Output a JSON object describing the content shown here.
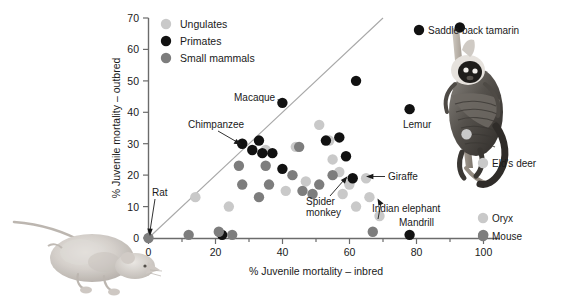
{
  "figure": {
    "title": "",
    "background": "#ffffff"
  },
  "colors": {
    "ungulates": "#c9c9c9",
    "primates": "#111111",
    "small_mammals": "#7d7d7d",
    "axis": "#6b6b6b",
    "diagonal": "#a8a8a8",
    "text": "#1a1a1a"
  },
  "axes": {
    "xlabel": "% Juvenile mortality – inbred",
    "ylabel": "% Juvenile mortality – outbred",
    "xticks": [
      0,
      20,
      40,
      60,
      80,
      100
    ],
    "xtick_labels": [
      "0",
      "20",
      "40",
      "60",
      "80",
      "100"
    ],
    "xminor": [
      10,
      30,
      50,
      70,
      90
    ],
    "yticks": [
      0,
      10,
      20,
      30,
      40,
      50,
      60,
      70
    ],
    "ytick_labels": [
      "0",
      "10",
      "20",
      "30",
      "40",
      "50",
      "60",
      "70"
    ],
    "xlim": [
      0,
      105
    ],
    "ylim": [
      0,
      70
    ],
    "grid": false
  },
  "legend": {
    "position": "top-left-inside",
    "entries": [
      {
        "label": "Ungulates",
        "color_key": "ungulates"
      },
      {
        "label": "Primates",
        "color_key": "primates"
      },
      {
        "label": "Small mammals",
        "color_key": "small_mammals"
      }
    ]
  },
  "reference_line": {
    "type": "identity",
    "label": "1:1 line",
    "from": [
      0,
      0
    ],
    "to": [
      70,
      70
    ]
  },
  "illustrations": [
    {
      "name": "rat-illustration",
      "caption": "Rat"
    },
    {
      "name": "saddle-back-tamarin-illustration",
      "caption": "Saddle back tamarin"
    }
  ],
  "chart_data": {
    "type": "scatter",
    "title": "",
    "xlabel": "% Juvenile mortality – inbred",
    "ylabel": "% Juvenile mortality – outbred",
    "xlim": [
      0,
      105
    ],
    "ylim": [
      0,
      70
    ],
    "grid": false,
    "legend_position": "upper left",
    "series": [
      {
        "name": "Ungulates",
        "color": "#c9c9c9",
        "points": [
          {
            "x": 14,
            "y": 13
          },
          {
            "x": 24,
            "y": 10
          },
          {
            "x": 28,
            "y": 30
          },
          {
            "x": 35,
            "y": 28
          },
          {
            "x": 41,
            "y": 15
          },
          {
            "x": 44,
            "y": 29
          },
          {
            "x": 47,
            "y": 18
          },
          {
            "x": 51,
            "y": 36
          },
          {
            "x": 54,
            "y": 31
          },
          {
            "x": 55,
            "y": 25
          },
          {
            "x": 57,
            "y": 21
          },
          {
            "x": 58,
            "y": 14
          },
          {
            "x": 60,
            "y": 17
          },
          {
            "x": 62,
            "y": 10
          },
          {
            "x": 65,
            "y": 19
          },
          {
            "x": 66,
            "y": 13
          },
          {
            "x": 69,
            "y": 7
          },
          {
            "x": 95,
            "y": 33
          }
        ]
      },
      {
        "name": "Primates",
        "color": "#111111",
        "points": [
          {
            "x": 22,
            "y": 1
          },
          {
            "x": 28,
            "y": 30
          },
          {
            "x": 31,
            "y": 28
          },
          {
            "x": 33,
            "y": 31
          },
          {
            "x": 34,
            "y": 27
          },
          {
            "x": 37,
            "y": 27
          },
          {
            "x": 40,
            "y": 43
          },
          {
            "x": 40,
            "y": 22
          },
          {
            "x": 53,
            "y": 31
          },
          {
            "x": 57,
            "y": 32
          },
          {
            "x": 59,
            "y": 26
          },
          {
            "x": 62,
            "y": 50
          },
          {
            "x": 61,
            "y": 19
          },
          {
            "x": 78,
            "y": 41
          },
          {
            "x": 78,
            "y": 1
          },
          {
            "x": 93,
            "y": 67
          }
        ]
      },
      {
        "name": "Small mammals",
        "color": "#7d7d7d",
        "points": [
          {
            "x": 0,
            "y": 0
          },
          {
            "x": 12,
            "y": 1
          },
          {
            "x": 21,
            "y": 2
          },
          {
            "x": 25,
            "y": 1
          },
          {
            "x": 27,
            "y": 23
          },
          {
            "x": 28,
            "y": 17
          },
          {
            "x": 33,
            "y": 13
          },
          {
            "x": 35,
            "y": 23
          },
          {
            "x": 36,
            "y": 17
          },
          {
            "x": 43,
            "y": 20
          },
          {
            "x": 45,
            "y": 29
          },
          {
            "x": 46,
            "y": 15
          },
          {
            "x": 49,
            "y": 14
          },
          {
            "x": 51,
            "y": 17
          },
          {
            "x": 55,
            "y": 20
          },
          {
            "x": 67,
            "y": 2
          },
          {
            "x": 100,
            "y": 1
          }
        ]
      }
    ],
    "annotations": [
      {
        "label": "Rat",
        "x": 0,
        "y": 0,
        "series": "Small mammals"
      },
      {
        "label": "Chimpanzee",
        "x": 28,
        "y": 30,
        "series": "Ungulates"
      },
      {
        "label": "Macaque",
        "x": 40,
        "y": 43,
        "series": "Primates"
      },
      {
        "label": "Spider\nmonkey",
        "x": 61,
        "y": 19,
        "series": "Primates"
      },
      {
        "label": "Giraffe",
        "x": 65,
        "y": 19,
        "series": "Ungulates"
      },
      {
        "label": "Indian elephant",
        "x": 69,
        "y": 7,
        "series": "Ungulates"
      },
      {
        "label": "Lemur",
        "x": 78,
        "y": 41,
        "series": "Primates"
      },
      {
        "label": "Mandrill",
        "x": 78,
        "y": 1,
        "series": "Primates"
      },
      {
        "label": "Saddle back tamarin",
        "x": 93,
        "y": 67,
        "series": "Primates"
      },
      {
        "label": "Eld's deer",
        "x": 95,
        "y": 33,
        "series": "Ungulates"
      },
      {
        "label": "Oryx",
        "x": 95,
        "y": 8,
        "series": "Ungulates"
      },
      {
        "label": "Mouse",
        "x": 100,
        "y": 1,
        "series": "Small mammals"
      }
    ],
    "annotation_texts": {
      "rat": "Rat",
      "chimpanzee": "Chimpanzee",
      "macaque": "Macaque",
      "spider_monkey_line1": "Spider",
      "spider_monkey_line2": "monkey",
      "giraffe": "Giraffe",
      "indian_elephant": "Indian elephant",
      "lemur": "Lemur",
      "mandrill": "Mandrill",
      "saddle_back_tamarin": "Saddle back tamarin",
      "elds_deer": "Eld's deer",
      "oryx": "Oryx",
      "mouse": "Mouse"
    }
  }
}
